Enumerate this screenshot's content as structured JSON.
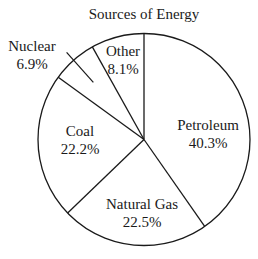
{
  "chart_data": {
    "type": "pie",
    "title": "Sources of Energy",
    "start_angle_deg": 0,
    "direction": "clockwise",
    "categories": [
      "Petroleum",
      "Natural Gas",
      "Coal",
      "Nuclear",
      "Other"
    ],
    "values": [
      40.3,
      22.5,
      22.2,
      6.9,
      8.1
    ],
    "value_labels": [
      "40.3%",
      "22.5%",
      "22.2%",
      "6.9%",
      "8.1%"
    ],
    "legend": "none",
    "colors": {
      "fill": "#ffffff",
      "stroke": "#1a1a1a"
    }
  }
}
